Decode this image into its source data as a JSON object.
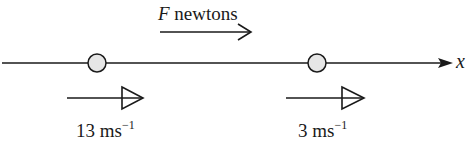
{
  "diagram": {
    "axis": {
      "label": "x",
      "direction": "right"
    },
    "force": {
      "symbol": "F",
      "unit_text": " newtons",
      "direction": "right"
    },
    "particles": [
      {
        "name": "particle-1",
        "velocity_value": "13",
        "velocity_unit": " ms",
        "velocity_exponent": "−1",
        "direction": "right"
      },
      {
        "name": "particle-2",
        "velocity_value": "3",
        "velocity_unit": " ms",
        "velocity_exponent": "−1",
        "direction": "right"
      }
    ],
    "colors": {
      "line": "#1a1a1a",
      "particle_fill": "#e6e6e6",
      "background": "#ffffff"
    }
  }
}
